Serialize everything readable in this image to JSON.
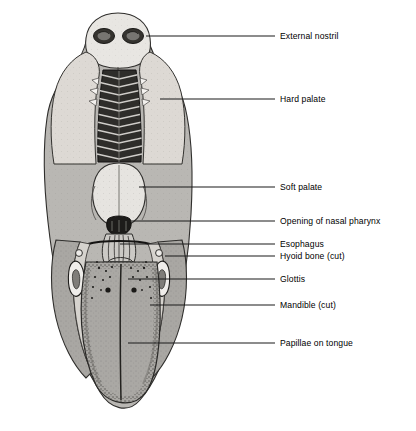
{
  "figure": {
    "width": 416,
    "height": 431
  },
  "colors": {
    "background": "#ffffff",
    "ink": "#000000",
    "leader_line": "#1a1a1a",
    "pale_tissue": "#e3e1dd",
    "mid_tissue": "#a8a6a2",
    "dark_tissue": "#4a4845",
    "palate_dark": "#2b2a28",
    "outline": "#3a3836"
  },
  "labels": [
    {
      "id": "external-nostril",
      "text": "External nostril",
      "text_x": 280,
      "text_y": 31,
      "leader_from_x": 146,
      "leader_from_y": 36,
      "leader_to_x": 275,
      "leader_to_y": 36
    },
    {
      "id": "hard-palate",
      "text": "Hard palate",
      "text_x": 280,
      "text_y": 94,
      "leader_from_x": 160,
      "leader_from_y": 99,
      "leader_to_x": 275,
      "leader_to_y": 99
    },
    {
      "id": "soft-palate",
      "text": "Soft palate",
      "text_x": 280,
      "text_y": 182,
      "leader_from_x": 139,
      "leader_from_y": 187,
      "leader_to_x": 275,
      "leader_to_y": 187
    },
    {
      "id": "opening-of-nasal-pharynx",
      "text": "Opening of nasal pharynx",
      "text_x": 280,
      "text_y": 216,
      "leader_from_x": 131,
      "leader_from_y": 221,
      "leader_to_x": 275,
      "leader_to_y": 221
    },
    {
      "id": "esophagus",
      "text": "Esophagus",
      "text_x": 280,
      "text_y": 239,
      "leader_from_x": 120,
      "leader_from_y": 244,
      "leader_to_x": 275,
      "leader_to_y": 244
    },
    {
      "id": "hyoid-bone-cut",
      "text": "Hyoid bone (cut)",
      "text_x": 280,
      "text_y": 251,
      "leader_from_x": 165,
      "leader_from_y": 256,
      "leader_to_x": 275,
      "leader_to_y": 256
    },
    {
      "id": "glottis",
      "text": "Glottis",
      "text_x": 280,
      "text_y": 274,
      "leader_from_x": 128,
      "leader_from_y": 279,
      "leader_to_x": 275,
      "leader_to_y": 279
    },
    {
      "id": "mandible-cut",
      "text": "Mandible (cut)",
      "text_x": 280,
      "text_y": 300,
      "leader_from_x": 150,
      "leader_from_y": 305,
      "leader_to_x": 275,
      "leader_to_y": 305
    },
    {
      "id": "papillae-on-tongue",
      "text": "Papillae on tongue",
      "text_x": 280,
      "text_y": 338,
      "leader_from_x": 128,
      "leader_from_y": 343,
      "leader_to_x": 275,
      "leader_to_y": 343
    }
  ]
}
